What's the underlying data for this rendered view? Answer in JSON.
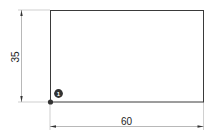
{
  "diagram": {
    "type": "dimensioned-rectangle",
    "shape": {
      "name": "rectangle",
      "width": 60,
      "height": 35
    },
    "dimensions": {
      "vertical": {
        "label": "35"
      },
      "horizontal": {
        "label": "60"
      }
    },
    "origin_point": {
      "badge_label": "1"
    },
    "colors": {
      "stroke": "#3a3a3a",
      "dimension_line": "#9a9a9a",
      "badge_fill": "#333333",
      "point_fill": "#333333"
    }
  }
}
